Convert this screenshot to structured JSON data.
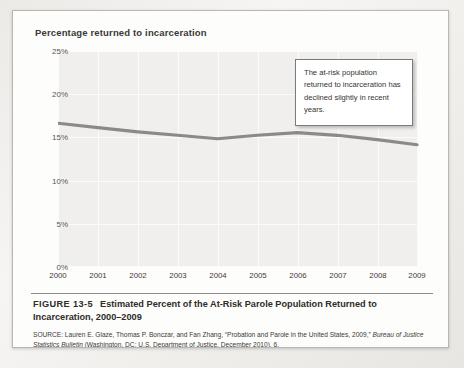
{
  "figure": {
    "axis_title": "Percentage returned to incarceration",
    "caption_number": "FIGURE 13-5",
    "caption_title": "Estimated Percent of the At-Risk Parole Population Returned to Incarceration, 2000–2009",
    "source_line1": "SOURCE: Lauren E. Glaze, Thomas P. Bonczar, and Fan Zhang, “Probation and Parole in the United States, 2009,”",
    "source_italic": "Bureau of Justice Statistics Bulletin",
    "source_line2_rest": " (Washington, DC: U.S. Department of Justice, December 2010), 6."
  },
  "callout": {
    "text": "The at-risk population returned to incarceration has declined slightly in recent years."
  },
  "colors": {
    "line": "#8b8a87",
    "plot_bg": "#f0efed",
    "grid": "#fbfbfa",
    "card_bg": "#fdfdfc",
    "text": "#34332f"
  },
  "chart_data": {
    "type": "line",
    "title": "Percentage returned to incarceration",
    "xlabel": "",
    "ylabel": "Percentage returned to incarceration",
    "categories": [
      "2000",
      "2001",
      "2002",
      "2003",
      "2004",
      "2005",
      "2006",
      "2007",
      "2008",
      "2009"
    ],
    "x": [
      2000,
      2001,
      2002,
      2003,
      2004,
      2005,
      2006,
      2007,
      2008,
      2009
    ],
    "values": [
      16.6,
      16.1,
      15.6,
      15.2,
      14.8,
      15.2,
      15.5,
      15.2,
      14.7,
      14.1
    ],
    "series": [
      {
        "name": "Percent returned to incarceration",
        "values": [
          16.6,
          16.1,
          15.6,
          15.2,
          14.8,
          15.2,
          15.5,
          15.2,
          14.7,
          14.1
        ]
      }
    ],
    "ylim": [
      0,
      25
    ],
    "yticks": [
      0,
      5,
      10,
      15,
      20,
      25
    ],
    "ytick_labels": [
      "0%",
      "5%",
      "10%",
      "15%",
      "20%",
      "25%"
    ],
    "xlim": [
      2000,
      2009
    ],
    "grid": true,
    "legend": false,
    "annotations": [
      {
        "text": "The at-risk population returned to incarceration has declined slightly in recent years.",
        "points_to_year": 2007
      }
    ]
  }
}
